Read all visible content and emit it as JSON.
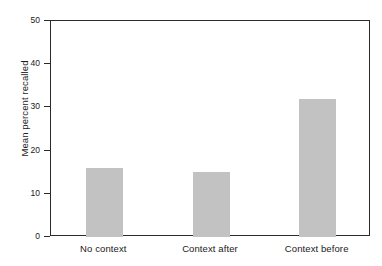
{
  "chart_data": {
    "type": "bar",
    "title": "",
    "xlabel": "",
    "ylabel": "Mean percent recalled",
    "categories": [
      "No context",
      "Context after",
      "Context before"
    ],
    "values": [
      16,
      15,
      32
    ],
    "series": [
      {
        "name": "Mean percent recalled",
        "values": [
          16,
          15,
          32
        ]
      }
    ],
    "ylim": [
      0,
      50
    ],
    "yticks": [
      0,
      10,
      20,
      30,
      40,
      50
    ],
    "ytick_labels": [
      "0",
      "10",
      "20",
      "30",
      "40",
      "50"
    ],
    "grid": false,
    "legend": false,
    "legend_position": "none",
    "bar_color": "#c2c2c2",
    "axis_color": "#2b2b2b",
    "background_color": "#ffffff",
    "frame": "box",
    "annotations": []
  }
}
